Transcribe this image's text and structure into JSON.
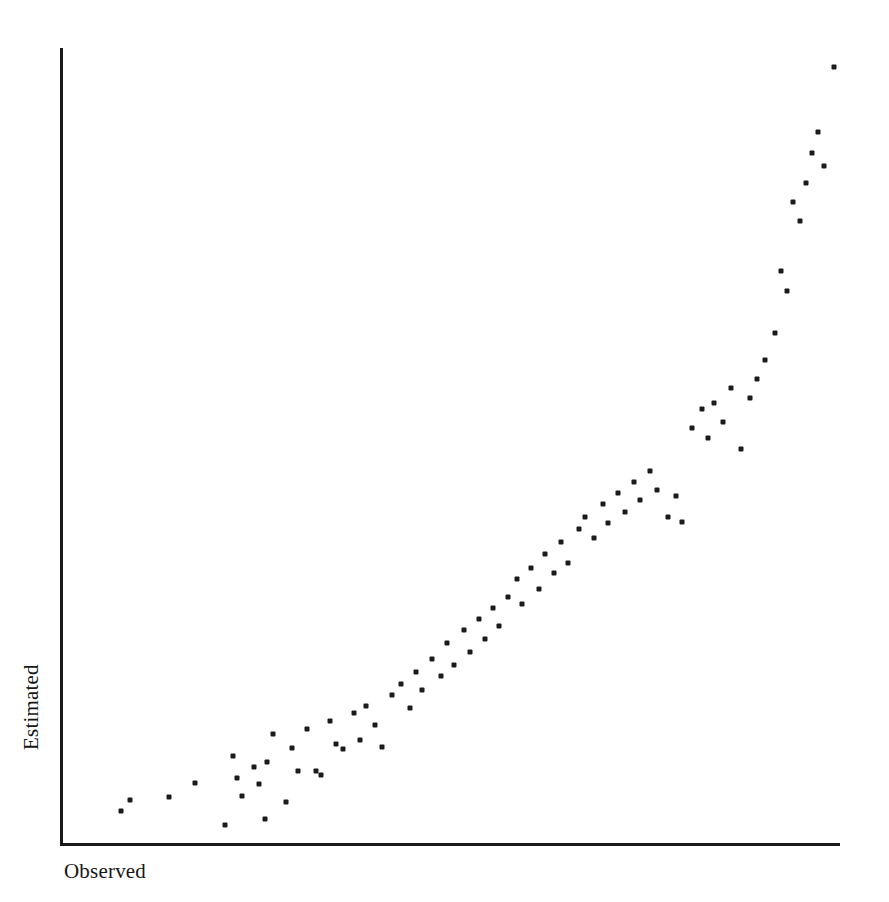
{
  "chart_data": {
    "type": "scatter",
    "title": "",
    "subtitle": "",
    "xlabel": "Observed",
    "ylabel": "Estimated",
    "grid": false,
    "legend": null,
    "legend_position": "none",
    "axis_style": "L-shaped spine, no tick marks, no tick labels",
    "xlim": [
      0,
      100
    ],
    "ylim": [
      0,
      100
    ],
    "x_tick_labels": [],
    "y_tick_labels": [],
    "marker": {
      "shape": "square-dot",
      "color": "#1b1b1b",
      "size_px": 5
    },
    "annotations": [],
    "n_points": 85,
    "points": [
      [
        7.5,
        4.0
      ],
      [
        8.6,
        5.4
      ],
      [
        13.7,
        5.8
      ],
      [
        17.0,
        7.5
      ],
      [
        20.8,
        2.3
      ],
      [
        21.9,
        11.0
      ],
      [
        22.4,
        8.2
      ],
      [
        23.1,
        5.9
      ],
      [
        24.6,
        9.6
      ],
      [
        25.2,
        7.4
      ],
      [
        26.0,
        3.0
      ],
      [
        26.3,
        10.2
      ],
      [
        27.0,
        13.7
      ],
      [
        28.7,
        5.1
      ],
      [
        29.5,
        12.0
      ],
      [
        30.2,
        9.1
      ],
      [
        31.4,
        14.3
      ],
      [
        32.5,
        9.0
      ],
      [
        33.2,
        8.5
      ],
      [
        34.3,
        15.3
      ],
      [
        35.1,
        12.5
      ],
      [
        36.0,
        11.8
      ],
      [
        37.4,
        16.4
      ],
      [
        38.2,
        13.0
      ],
      [
        39.0,
        17.2
      ],
      [
        40.1,
        14.8
      ],
      [
        41.0,
        12.1
      ],
      [
        42.3,
        18.6
      ],
      [
        43.5,
        20.0
      ],
      [
        44.6,
        17.0
      ],
      [
        45.4,
        21.5
      ],
      [
        46.2,
        19.3
      ],
      [
        47.5,
        23.2
      ],
      [
        48.6,
        21.0
      ],
      [
        49.4,
        25.1
      ],
      [
        50.3,
        22.4
      ],
      [
        51.6,
        26.8
      ],
      [
        52.4,
        24.0
      ],
      [
        53.5,
        28.2
      ],
      [
        54.3,
        25.7
      ],
      [
        55.4,
        29.6
      ],
      [
        56.1,
        27.3
      ],
      [
        57.3,
        31.0
      ],
      [
        58.4,
        33.2
      ],
      [
        59.1,
        30.1
      ],
      [
        60.2,
        34.6
      ],
      [
        61.3,
        32.0
      ],
      [
        62.0,
        36.4
      ],
      [
        63.2,
        34.0
      ],
      [
        64.1,
        37.8
      ],
      [
        65.0,
        35.2
      ],
      [
        66.4,
        39.5
      ],
      [
        67.2,
        41.0
      ],
      [
        68.3,
        38.4
      ],
      [
        69.5,
        42.6
      ],
      [
        70.1,
        40.2
      ],
      [
        71.4,
        44.0
      ],
      [
        72.3,
        41.6
      ],
      [
        73.5,
        45.4
      ],
      [
        74.2,
        43.1
      ],
      [
        75.6,
        46.8
      ],
      [
        76.4,
        44.4
      ],
      [
        77.8,
        41.0
      ],
      [
        78.9,
        43.6
      ],
      [
        79.7,
        40.4
      ],
      [
        81.0,
        52.2
      ],
      [
        82.2,
        54.6
      ],
      [
        83.0,
        51.0
      ],
      [
        83.8,
        55.4
      ],
      [
        84.9,
        53.0
      ],
      [
        86.0,
        57.2
      ],
      [
        87.2,
        49.6
      ],
      [
        88.4,
        56.0
      ],
      [
        89.3,
        58.4
      ],
      [
        90.4,
        60.8
      ],
      [
        91.6,
        64.2
      ],
      [
        92.4,
        72.0
      ],
      [
        93.2,
        69.4
      ],
      [
        94.0,
        80.6
      ],
      [
        94.8,
        78.2
      ],
      [
        95.6,
        83.0
      ],
      [
        96.4,
        86.8
      ],
      [
        97.2,
        89.4
      ],
      [
        97.9,
        85.2
      ],
      [
        99.2,
        97.6
      ]
    ]
  },
  "figure": {
    "accessible_title": "Scatter plot of Estimated versus Observed values",
    "background_color": "#ffffff",
    "axis_color": "#1a1a1a"
  }
}
